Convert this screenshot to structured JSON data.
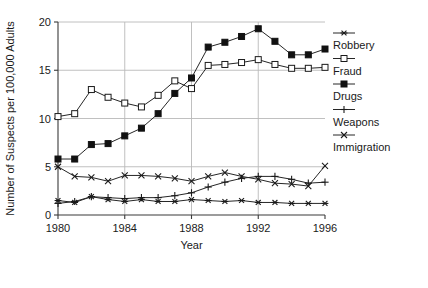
{
  "chart_data": {
    "type": "line",
    "title": "",
    "xlabel": "Year",
    "ylabel": "Number of Suspects per 100,000 Adults",
    "x": [
      1980,
      1981,
      1982,
      1983,
      1984,
      1985,
      1986,
      1987,
      1988,
      1989,
      1990,
      1991,
      1992,
      1993,
      1994,
      1995,
      1996
    ],
    "xlim": [
      1980,
      1996
    ],
    "ylim": [
      0,
      20
    ],
    "xticks": [
      1980,
      1984,
      1988,
      1992,
      1996
    ],
    "xtick_labels": [
      "1980",
      "1984",
      "1988",
      "1992",
      "1996"
    ],
    "yticks": [
      0,
      5,
      10,
      15,
      20
    ],
    "ytick_labels": [
      "0",
      "5",
      "10",
      "15",
      "20"
    ],
    "grid": true,
    "legend_position": "right",
    "series": [
      {
        "name": "Robbery",
        "marker": "asterisk",
        "values": [
          1.5,
          1.3,
          1.9,
          1.6,
          1.4,
          1.6,
          1.4,
          1.4,
          1.6,
          1.5,
          1.4,
          1.5,
          1.3,
          1.3,
          1.2,
          1.2,
          1.2
        ]
      },
      {
        "name": "Fraud",
        "marker": "open-square",
        "values": [
          10.2,
          10.5,
          13.0,
          12.2,
          11.6,
          11.2,
          12.4,
          13.9,
          13.1,
          15.5,
          15.6,
          15.8,
          16.1,
          15.6,
          15.2,
          15.2,
          15.3
        ]
      },
      {
        "name": "Drugs",
        "marker": "filled-square",
        "values": [
          5.8,
          5.8,
          7.3,
          7.4,
          8.2,
          9.0,
          10.5,
          12.6,
          14.2,
          17.4,
          17.9,
          18.5,
          19.3,
          18.0,
          16.6,
          16.6,
          17.2
        ]
      },
      {
        "name": "Weapons",
        "marker": "plus",
        "values": [
          1.2,
          1.4,
          1.9,
          1.8,
          1.7,
          1.8,
          1.8,
          2.0,
          2.3,
          2.9,
          3.4,
          3.8,
          4.0,
          4.0,
          3.7,
          3.3,
          3.4
        ]
      },
      {
        "name": "Immigration",
        "marker": "cross",
        "values": [
          5.0,
          4.0,
          3.9,
          3.5,
          4.1,
          4.1,
          4.0,
          3.8,
          3.5,
          4.0,
          4.4,
          4.0,
          3.7,
          3.3,
          3.2,
          3.0,
          5.1
        ]
      }
    ]
  }
}
